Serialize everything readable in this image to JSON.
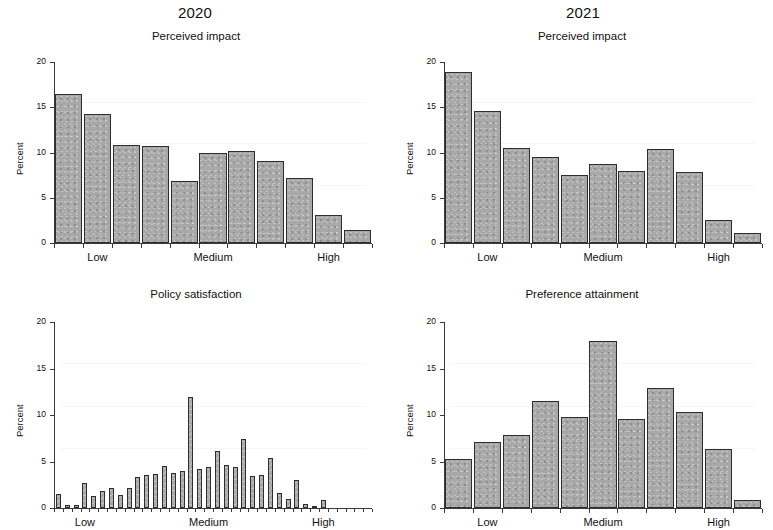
{
  "figure": {
    "column_titles": [
      "2020",
      "2021"
    ],
    "y_axis_label": "Percent",
    "y_ticks": [
      0,
      5,
      10,
      15,
      20
    ],
    "x_tick_labels": [
      "Low",
      "Medium",
      "High"
    ]
  },
  "chart_data": [
    {
      "id": "perceived-impact-2020",
      "type": "bar",
      "title": "Perceived impact",
      "column": "2020",
      "xlabel": "",
      "ylabel": "Percent",
      "ylim": [
        0,
        20
      ],
      "yticks": [
        0,
        5,
        10,
        15,
        20
      ],
      "grid": false,
      "categories": [
        "1",
        "2",
        "3",
        "4",
        "5",
        "6",
        "7",
        "8",
        "9",
        "10",
        "11"
      ],
      "xtick_labels": [
        "Low",
        "Medium",
        "High"
      ],
      "xtick_positions": [
        2,
        6,
        10
      ],
      "values": [
        16.5,
        14.3,
        10.8,
        10.7,
        6.9,
        10.0,
        10.2,
        9.1,
        7.2,
        3.1,
        1.4
      ]
    },
    {
      "id": "perceived-impact-2021",
      "type": "bar",
      "title": "Perceived impact",
      "column": "2021",
      "xlabel": "",
      "ylabel": "Percent",
      "ylim": [
        0,
        20
      ],
      "yticks": [
        0,
        5,
        10,
        15,
        20
      ],
      "grid": false,
      "categories": [
        "1",
        "2",
        "3",
        "4",
        "5",
        "6",
        "7",
        "8",
        "9",
        "10",
        "11"
      ],
      "xtick_labels": [
        "Low",
        "Medium",
        "High"
      ],
      "xtick_positions": [
        2,
        6,
        10
      ],
      "values": [
        18.9,
        14.6,
        10.5,
        9.5,
        7.5,
        8.7,
        8.0,
        10.4,
        7.9,
        2.5,
        1.1
      ]
    },
    {
      "id": "policy-satisfaction-2020",
      "type": "bar",
      "title": "Policy satisfaction",
      "column": "2020",
      "xlabel": "",
      "ylabel": "Percent",
      "ylim": [
        0,
        20
      ],
      "yticks": [
        0,
        5,
        10,
        15,
        20
      ],
      "grid": false,
      "categories": [
        "1",
        "2",
        "3",
        "4",
        "5",
        "6",
        "7",
        "8",
        "9",
        "10",
        "11",
        "12",
        "13",
        "14",
        "15",
        "16",
        "17",
        "18",
        "19",
        "20",
        "21",
        "22",
        "23",
        "24",
        "25",
        "26",
        "27",
        "28",
        "29",
        "30",
        "31",
        "32",
        "33",
        "34",
        "35",
        "36"
      ],
      "xtick_labels": [
        "Low",
        "Medium",
        "High"
      ],
      "xtick_positions": [
        4,
        18,
        31
      ],
      "values": [
        1.5,
        0.35,
        0.35,
        2.7,
        1.3,
        1.8,
        2.2,
        1.4,
        2.2,
        3.3,
        3.5,
        3.7,
        4.5,
        3.8,
        4.0,
        11.9,
        4.2,
        4.4,
        6.1,
        4.6,
        4.4,
        7.4,
        3.4,
        3.6,
        5.4,
        1.6,
        1.0,
        3.0,
        0.4,
        0.25,
        0.9,
        0,
        0,
        0,
        0,
        0
      ]
    },
    {
      "id": "preference-attainment-2021",
      "type": "bar",
      "title": "Preference attainment",
      "column": "2021",
      "xlabel": "",
      "ylabel": "Percent",
      "ylim": [
        0,
        20
      ],
      "yticks": [
        0,
        5,
        10,
        15,
        20
      ],
      "grid": false,
      "categories": [
        "1",
        "2",
        "3",
        "4",
        "5",
        "6",
        "7",
        "8",
        "9",
        "10",
        "11"
      ],
      "xtick_labels": [
        "Low",
        "Medium",
        "High"
      ],
      "xtick_positions": [
        2,
        6,
        10
      ],
      "values": [
        5.3,
        7.1,
        7.8,
        11.5,
        9.8,
        18.0,
        9.6,
        12.9,
        10.3,
        6.3,
        0.9
      ]
    }
  ]
}
